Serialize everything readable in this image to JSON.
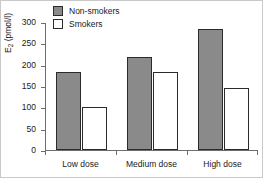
{
  "chart_data": {
    "type": "bar",
    "title": "",
    "xlabel": "",
    "ylabel": "E2 (pmol/l)",
    "ylabel_base": "E",
    "ylabel_sub": "2",
    "ylabel_unit": " (pmol/l)",
    "categories": [
      "Low dose",
      "Medium dose",
      "High dose"
    ],
    "series": [
      {
        "name": "Non-smokers",
        "color": "#8a8a8a",
        "values": [
          183,
          217,
          283
        ]
      },
      {
        "name": "Smokers",
        "color": "#ffffff",
        "values": [
          101,
          184,
          145
        ]
      }
    ],
    "ylim": [
      0,
      300
    ],
    "yticks": [
      0,
      50,
      100,
      150,
      200,
      250,
      300
    ],
    "ytick_labels": [
      "0",
      "50",
      "100",
      "150",
      "200",
      "250",
      "300"
    ],
    "grid": false,
    "legend_position": "top-left"
  },
  "legend": {
    "items": [
      {
        "label": "Non-smokers",
        "swatch": "filled-gray-square"
      },
      {
        "label": "Smokers",
        "swatch": "hollow-white-square"
      }
    ]
  },
  "colors": {
    "nonsmokers_fill": "#8a8a8a",
    "smokers_fill": "#ffffff",
    "bar_outline": "#2b2b2b",
    "axis": "#6d6d6d",
    "text": "#1a1a1a",
    "background": "#ffffff",
    "frame": "#c9c9c9"
  }
}
